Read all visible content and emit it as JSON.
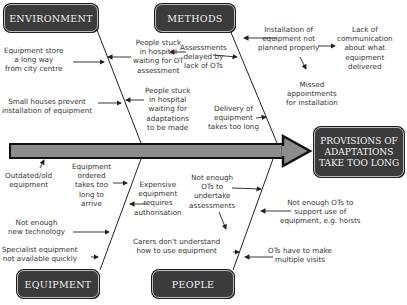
{
  "diagram": {
    "type": "fishbone",
    "effect": {
      "lines": [
        "PROVISIONS OF",
        "ADAPTATIONS",
        "TAKE TOO LONG"
      ]
    },
    "categories": {
      "environment": "ENVIRONMENT",
      "methods": "METHODS",
      "equipment": "EQUIPMENT",
      "people": "PEOPLE"
    },
    "causes": {
      "environment": [
        {
          "lines": [
            "Equipment store",
            "a long way",
            "from city centre"
          ]
        },
        {
          "lines": [
            "Small houses prevent",
            "installation of equipment"
          ]
        },
        {
          "lines": [
            "People stuck",
            "in hospital",
            "waiting for OT",
            "assessment"
          ]
        },
        {
          "lines": [
            "People stuck",
            "in hospital",
            "waiting for",
            "adaptations",
            "to be made"
          ]
        }
      ],
      "methods": [
        {
          "lines": [
            "Assessments",
            "delayed by",
            "lack of OTs"
          ]
        },
        {
          "lines": [
            "Installation of",
            "equipment not",
            "planned properly"
          ]
        },
        {
          "lines": [
            "Lack of",
            "communication",
            "about what",
            "equipment",
            "delivered"
          ]
        },
        {
          "lines": [
            "Missed",
            "appointments",
            "for installation"
          ]
        },
        {
          "lines": [
            "Delivery of",
            "equipment",
            "takes too long"
          ]
        }
      ],
      "equipment": [
        {
          "lines": [
            "Outdated/old",
            "equipment"
          ]
        },
        {
          "lines": [
            "Equipment",
            "ordered",
            "takes too",
            "long to",
            "arrive"
          ]
        },
        {
          "lines": [
            "Expensive",
            "equipment",
            "requires",
            "authorisation"
          ]
        },
        {
          "lines": [
            "Not enough",
            "new technology"
          ]
        },
        {
          "lines": [
            "Specialist equipment",
            "not available quickly"
          ]
        }
      ],
      "people": [
        {
          "lines": [
            "Not enough",
            "OTs to",
            "undertake",
            "assessments"
          ]
        },
        {
          "lines": [
            "Carers don't understand",
            "how to use equipment"
          ]
        },
        {
          "lines": [
            "Not enough OTs to",
            "support use of",
            "equipment, e.g. hoists"
          ]
        },
        {
          "lines": [
            "OTs have to make",
            "multiple visits"
          ]
        }
      ]
    },
    "colors": {
      "box_fill": "#3b3b3b",
      "box_text": "#f2f2f2",
      "spine_fill": "#8c8c8c",
      "line": "#222222"
    }
  }
}
